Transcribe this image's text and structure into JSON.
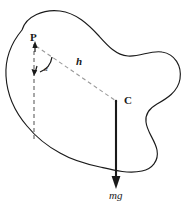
{
  "figure": {
    "type": "physics-free-body-diagram",
    "background_color": "#ffffff",
    "stroke_color": "#1a1a1a",
    "dashed_color": "#8a8a8a"
  },
  "labels": {
    "pivot": "P",
    "centre_of_mass": "C",
    "distance": "h",
    "weight": "mg",
    "angle": "α"
  },
  "elements": {
    "body_outline": "irregular-closed-blob",
    "vertical_dashed_line": "vertical-reference-through-P",
    "h_dashed_line": "line-from-P-to-C",
    "angle_arc": "arc-between-vertical-and-h",
    "weight_arrow": "downward-arrow-from-C",
    "pivot_arrow_up": "short-arrow-at-P",
    "pivot_arrow_down": "short-arrow-below-P"
  }
}
